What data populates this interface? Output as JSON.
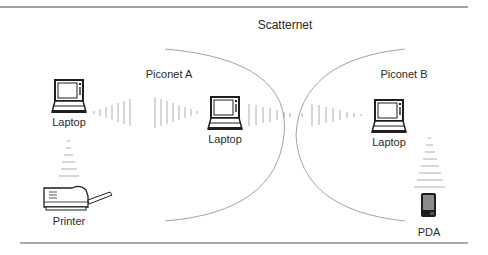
{
  "title": "Scatternet",
  "piconets": [
    {
      "label": "Piconet A"
    },
    {
      "label": "Piconet B"
    }
  ],
  "devices": [
    {
      "id": "laptop-left",
      "type": "laptop",
      "label": "Laptop"
    },
    {
      "id": "laptop-center",
      "type": "laptop",
      "label": "Laptop"
    },
    {
      "id": "laptop-right",
      "type": "laptop",
      "label": "Laptop"
    },
    {
      "id": "printer",
      "type": "printer",
      "label": "Printer"
    },
    {
      "id": "pda",
      "type": "pda",
      "label": "PDA"
    }
  ],
  "links": [
    {
      "from": "laptop-left",
      "to": "laptop-center",
      "style": "radio-waves"
    },
    {
      "from": "laptop-center",
      "to": "laptop-right",
      "style": "radio-waves"
    },
    {
      "from": "laptop-left",
      "to": "printer",
      "style": "radio-waves"
    },
    {
      "from": "laptop-right",
      "to": "pda",
      "style": "radio-waves"
    }
  ],
  "colors": {
    "rule": "#444444",
    "arc": "#8a8a8a",
    "wave": "#9a9a9a",
    "device": "#1e1e1e"
  }
}
